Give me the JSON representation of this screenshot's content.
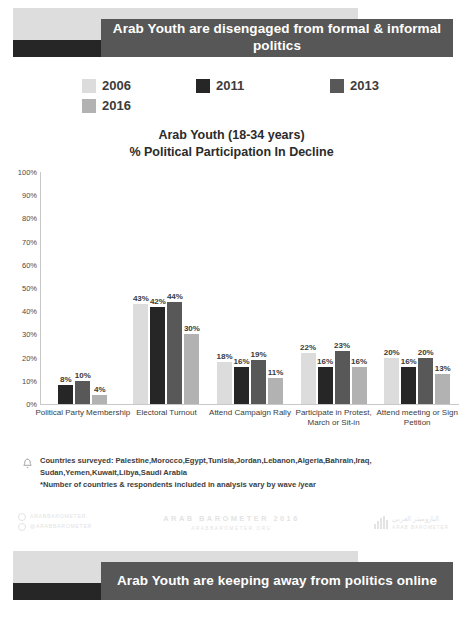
{
  "top_banner": {
    "text": "Arab Youth are disengaged from formal & informal politics"
  },
  "bottom_banner": {
    "text": "Arab Youth are keeping away from politics online"
  },
  "legend": {
    "items": [
      {
        "label": "2006",
        "color": "#dcdcdc"
      },
      {
        "label": "2011",
        "color": "#262626"
      },
      {
        "label": "2013",
        "color": "#585858"
      },
      {
        "label": "2016",
        "color": "#b2b2b2"
      }
    ]
  },
  "chart_title": {
    "line1": "Arab Youth (18-34 years)",
    "line2": "% Political Participation In Decline"
  },
  "footnote": {
    "icon": "bell-icon",
    "line1": "Countries surveyed: Palestine,Morocco,Egypt,Tunisia,Jordan,Lebanon,Algeria,Bahrain,Iraq,",
    "line2": "Sudan,Yemen,Kuwait,Libya,Saudi Arabia",
    "line3": "*Number of countries & respondents included in analysis vary by wave /year"
  },
  "brand": {
    "social_1": "ARABBAROMETER",
    "social_2": "@ARABBAROMETER",
    "center_big": "ARAB BAROMETER 2016",
    "center_small": "ARABBAROMETER.ORG",
    "right_ar": "الباروميتر العربي",
    "right_en": "ARAB BAROMETER"
  },
  "chart_data": {
    "type": "bar",
    "title": "Arab Youth (18-34 years) % Political Participation In Decline",
    "xlabel": "",
    "ylabel": "",
    "ylim": [
      0,
      100
    ],
    "grid": false,
    "legend_position": "top",
    "yticks": [
      "100%",
      "90%",
      "80%",
      "70%",
      "60%",
      "50%",
      "40%",
      "30%",
      "20%",
      "10%",
      "0%"
    ],
    "ytick_values": [
      100,
      90,
      80,
      70,
      60,
      50,
      40,
      30,
      20,
      10,
      0
    ],
    "categories": [
      "Political Party Membership",
      "Electoral Turnout",
      "Attend Campaign Rally",
      "Participate in Protest, March or Sit-in",
      "Attend meeting or Sign Petition"
    ],
    "series": [
      {
        "name": "2006",
        "color": "#dcdcdc",
        "values": [
          null,
          43,
          18,
          22,
          20
        ],
        "labels": [
          "",
          "43%",
          "18%",
          "22%",
          "20%"
        ]
      },
      {
        "name": "2011",
        "color": "#262626",
        "values": [
          8,
          42,
          16,
          16,
          16
        ],
        "labels": [
          "8%",
          "42%",
          "16%",
          "16%",
          "16%"
        ]
      },
      {
        "name": "2013",
        "color": "#585858",
        "values": [
          10,
          44,
          19,
          23,
          20
        ],
        "labels": [
          "10%",
          "44%",
          "19%",
          "23%",
          "20%"
        ]
      },
      {
        "name": "2016",
        "color": "#b2b2b2",
        "values": [
          4,
          30,
          11,
          16,
          13
        ],
        "labels": [
          "4%",
          "30%",
          "11%",
          "16%",
          "13%"
        ]
      }
    ]
  }
}
